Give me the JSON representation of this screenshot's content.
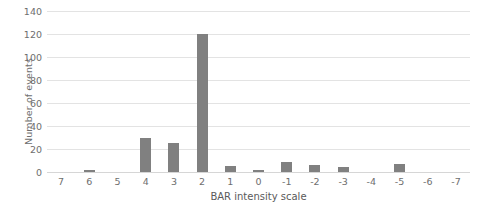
{
  "chart_data": {
    "type": "bar",
    "title": "",
    "subtitle": "",
    "xlabel": "BAR intensity scale",
    "ylabel": "Number of events",
    "categories": [
      "7",
      "6",
      "5",
      "4",
      "3",
      "2",
      "1",
      "0",
      "-1",
      "-2",
      "-3",
      "-4",
      "-5",
      "-6",
      "-7"
    ],
    "values": [
      0,
      2,
      0,
      30,
      25,
      120,
      5,
      1,
      9,
      6,
      4,
      0,
      7,
      0,
      0
    ],
    "yticks": [
      "0",
      "20",
      "40",
      "60",
      "80",
      "100",
      "120",
      "140"
    ],
    "ylim": [
      0,
      140
    ],
    "ytick_step": 20,
    "grid": "horizontal",
    "legend": "none",
    "bar_color": "#808080",
    "gridline_color": "#e3e3e3",
    "axis_text_color": "#6e6e6e"
  },
  "caption": {
    "text": ""
  }
}
